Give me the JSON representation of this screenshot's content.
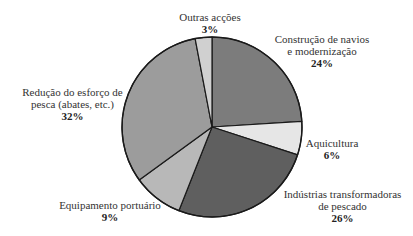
{
  "chart_data": {
    "type": "pie",
    "title": "",
    "start_angle_deg": 0,
    "direction": "clockwise",
    "center": [
      212,
      127
    ],
    "radius": 90,
    "slices": [
      {
        "label": "Construção de navios e modernização",
        "label_lines": [
          "Construção de navios",
          "e modernização"
        ],
        "value": 24,
        "pct_text": "24%",
        "color": "#7c7c7c"
      },
      {
        "label": "Aquicultura",
        "label_lines": [
          "Aquicultura"
        ],
        "value": 6,
        "pct_text": "6%",
        "color": "#e6e6e6"
      },
      {
        "label": "Indústrias transformadoras de pescado",
        "label_lines": [
          "Indústrias transformadoras",
          "de pescado"
        ],
        "value": 26,
        "pct_text": "26%",
        "color": "#5f5f5f"
      },
      {
        "label": "Equipamento portuário",
        "label_lines": [
          "Equipamento portuário"
        ],
        "value": 9,
        "pct_text": "9%",
        "color": "#b8b8b8"
      },
      {
        "label": "Redução do esforço de pesca (abates, etc.)",
        "label_lines": [
          "Redução do esforço de",
          "pesca (abates, etc.)"
        ],
        "value": 32,
        "pct_text": "32%",
        "color": "#9c9c9c"
      },
      {
        "label": "Outras acções",
        "label_lines": [
          "Outras acções"
        ],
        "value": 3,
        "pct_text": "3%",
        "color": "#d0d0d0"
      }
    ],
    "legend": "none (direct labels)"
  },
  "labels": {
    "outras": {
      "line1": "Outras acções",
      "pct": "3%"
    },
    "construcao": {
      "line1": "Construção de navios",
      "line2": "e modernização",
      "pct": "24%"
    },
    "aquicultura": {
      "line1": "Aquicultura",
      "pct": "6%"
    },
    "industrias": {
      "line1": "Indústrias transformadoras",
      "line2": "de pescado",
      "pct": "26%"
    },
    "equipamento": {
      "line1": "Equipamento portuário",
      "pct": "9%"
    },
    "reducao": {
      "line1": "Redução do esforço de",
      "line2": "pesca (abates, etc.)",
      "pct": "32%"
    }
  }
}
